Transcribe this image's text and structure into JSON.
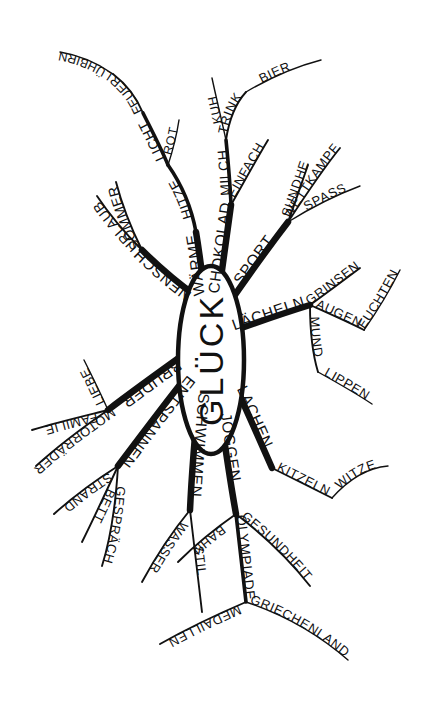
{
  "diagram": {
    "kind": "mind-map",
    "language": "de",
    "style": "hand-drawn black ink on white",
    "background_color": "#ffffff",
    "ink_color": "#111111",
    "center": {
      "label": "GLÜCK"
    },
    "branches": [
      {
        "label": "WÄRME",
        "children": [
          {
            "label": "HITZE",
            "children": [
              {
                "label": "LICHT",
                "children": [
                  {
                    "label": "FEUER",
                    "children": [
                      {
                        "label": "GLÜHBIRNE"
                      }
                    ]
                  }
                ]
              },
              {
                "label": "ROT"
              }
            ]
          }
        ]
      },
      {
        "label": "SONNENSCHEIN",
        "children": [
          {
            "label": "SOMMER",
            "children": [
              {
                "label": "URLAUB"
              }
            ]
          }
        ]
      },
      {
        "label": "SCHOKOLADE",
        "children": [
          {
            "label": "MILCH",
            "children": [
              {
                "label": "TRINK",
                "children": [
                  {
                    "label": "BIER"
                  }
                ]
              },
              {
                "label": "KUH"
              }
            ]
          },
          {
            "label": "EINFACH"
          }
        ]
      },
      {
        "label": "SPORT",
        "children": [
          {
            "label": "GESUNDHEIT"
          },
          {
            "label": "WETTKAMPF"
          },
          {
            "label": "SPASS"
          }
        ]
      },
      {
        "label": "LÄCHELN",
        "children": [
          {
            "label": "GRINSEN"
          },
          {
            "label": "AUGEN",
            "children": [
              {
                "label": "LEUCHTEND"
              }
            ]
          },
          {
            "label": "MUND",
            "children": [
              {
                "label": "LIPPEN"
              }
            ]
          }
        ]
      },
      {
        "label": "LACHEN",
        "children": [
          {
            "label": "KITZELN",
            "children": [
              {
                "label": "WITZE"
              }
            ]
          }
        ]
      },
      {
        "label": "JOGGEN",
        "children": [
          {
            "label": "BAHN"
          },
          {
            "label": "OLYMPIADE",
            "children": [
              {
                "label": "MEDAILLEN"
              },
              {
                "label": "GRIECHENLAND"
              }
            ]
          },
          {
            "label": "GESUNDHEIT"
          }
        ]
      },
      {
        "label": "SCHWIMMEN",
        "children": [
          {
            "label": "WASSER"
          },
          {
            "label": "STIL"
          }
        ]
      },
      {
        "label": "ENTSPANNEN",
        "children": [
          {
            "label": "STRAND"
          },
          {
            "label": "BETT"
          },
          {
            "label": "GESPRÄCH"
          }
        ]
      },
      {
        "label": "BRUDER",
        "children": [
          {
            "label": "LIEBE"
          },
          {
            "label": "FAMILIE"
          },
          {
            "label": "MOTORRÄDER"
          }
        ]
      }
    ],
    "labels": {
      "center": "GLÜCK",
      "waerme": "WÄRME",
      "hitze": "HITZE",
      "licht": "LICHT",
      "feuer": "FEUER",
      "gluehbirne": "GLÜHBIRNE",
      "rot": "ROT",
      "sonnenschein": "SONNENSCHEIN",
      "sommer": "SOMMER",
      "urlaub": "URLAUB",
      "schokolade": "SCHOKOLADE",
      "milch": "MILCH",
      "trink": "TRINK",
      "bier": "BIER",
      "kuh": "KUH",
      "einfach": "EINFACH",
      "sport": "SPORT",
      "gesundheit": "GESUNDHEIT",
      "wettkampf": "WETTKAMPF",
      "spass": "SPASS",
      "laecheln": "LÄCHELN",
      "grinsen": "GRINSEN",
      "augen": "AUGEN",
      "leuchtend": "LEUCHTEND",
      "mund": "MUND",
      "lippen": "LIPPEN",
      "lachen": "LACHEN",
      "kitzeln": "KITZELN",
      "witze": "WITZE",
      "joggen": "JOGGEN",
      "bahn": "BAHN",
      "olympiade": "OLYMPIADE",
      "medaillen": "MEDAILLEN",
      "griechenland": "GRIECHENLAND",
      "gesundheit2": "GESUNDHEIT",
      "schwimmen": "SCHWIMMEN",
      "wasser": "WASSER",
      "stil": "STIL",
      "entspannen": "ENTSPANNEN",
      "strand": "STRAND",
      "bett": "BETT",
      "gespraech": "GESPRÄCH",
      "bruder": "BRUDER",
      "liebe": "LIEBE",
      "familie": "FAMILIE",
      "motorraeder": "MOTORRÄDER"
    }
  }
}
